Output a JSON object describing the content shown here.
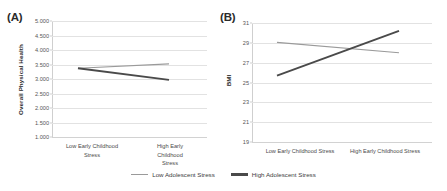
{
  "figure": {
    "panels": [
      {
        "tag": "(A)",
        "ylabel": "Overall Physical Health",
        "yticks": [
          "5.000",
          "4.500",
          "4.000",
          "3.500",
          "3.000",
          "2.500",
          "2.000",
          "1.500",
          "1.000"
        ],
        "xticks": [
          "Low Early Childhood\nStress",
          "High Early Childhood\nStress"
        ]
      },
      {
        "tag": "(B)",
        "ylabel": "BMI",
        "yticks": [
          "31",
          "29",
          "27",
          "25",
          "23",
          "21",
          "19"
        ],
        "xticks": [
          "Low Early Childhood Stress",
          "High Early Childhood Stress"
        ]
      }
    ]
  },
  "legend": {
    "items": [
      {
        "label": "Low Adolescent Stress",
        "color": "#9a9a9a"
      },
      {
        "label": "High Adolescent Stress",
        "color": "#4a4a4a"
      }
    ]
  },
  "chart_data": [
    {
      "type": "line",
      "title": "(A)",
      "xlabel": "",
      "ylabel": "Overall Physical Health",
      "categories": [
        "Low Early Childhood Stress",
        "High Early Childhood Stress"
      ],
      "ylim": [
        1.0,
        5.0
      ],
      "ytick_step": 0.5,
      "grid": true,
      "legend_position": "bottom-center",
      "series": [
        {
          "name": "Low Adolescent Stress",
          "values": [
            3.37,
            3.52
          ],
          "color": "#9a9a9a"
        },
        {
          "name": "High Adolescent Stress",
          "values": [
            3.37,
            2.97
          ],
          "color": "#4a4a4a"
        }
      ]
    },
    {
      "type": "line",
      "title": "(B)",
      "xlabel": "",
      "ylabel": "BMI",
      "categories": [
        "Low Early Childhood Stress",
        "High Early Childhood Stress"
      ],
      "ylim": [
        19,
        31
      ],
      "ytick_step": 2,
      "grid": true,
      "legend_position": "bottom-center",
      "series": [
        {
          "name": "Low Adolescent Stress",
          "values": [
            29.05,
            28.0
          ],
          "color": "#9a9a9a"
        },
        {
          "name": "High Adolescent Stress",
          "values": [
            25.7,
            30.2
          ],
          "color": "#4a4a4a"
        }
      ]
    }
  ]
}
